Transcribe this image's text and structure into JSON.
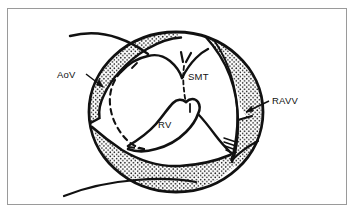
{
  "figure": {
    "type": "anatomical-line-drawing",
    "background_color": "#ffffff",
    "ink_color": "#111111",
    "border": {
      "color": "#9a9a9a",
      "width_px": 1,
      "x": 7,
      "y": 8,
      "width": 340,
      "height": 197
    },
    "labels": [
      {
        "id": "aov",
        "text": "AoV",
        "meaning": "aortic-valve",
        "x": 57,
        "y": 78,
        "leader": {
          "from_x": 86,
          "from_y": 74,
          "to_x": 104,
          "to_y": 87
        }
      },
      {
        "id": "smt",
        "text": "SMT",
        "meaning": "septomarginal-trabecula",
        "x": 188,
        "y": 80,
        "leader": null
      },
      {
        "id": "rv",
        "text": "RV",
        "meaning": "right-ventricle",
        "x": 158,
        "y": 128,
        "leader": null
      },
      {
        "id": "ravv",
        "text": "RAVV",
        "meaning": "right-atrioventricular-valve",
        "x": 272,
        "y": 104,
        "leader": {
          "from_x": 269,
          "from_y": 101,
          "to_x": 245,
          "to_y": 112
        }
      }
    ],
    "regions": {
      "circle_outline": {
        "name": "specimen-outline",
        "center_x": 176,
        "center_y": 112,
        "radius_x": 87,
        "radius_y": 80,
        "stroke_width": 2.6
      },
      "stipple": {
        "name": "stippled-myocardium",
        "dot_color": "#111111",
        "dot_spacing_px": 4.2,
        "dot_radius_px": 0.75
      },
      "dashed_outline": {
        "name": "aortic-valve-dashed-outline",
        "dash_pattern": "5 4",
        "stroke_width": 2.0
      }
    }
  }
}
